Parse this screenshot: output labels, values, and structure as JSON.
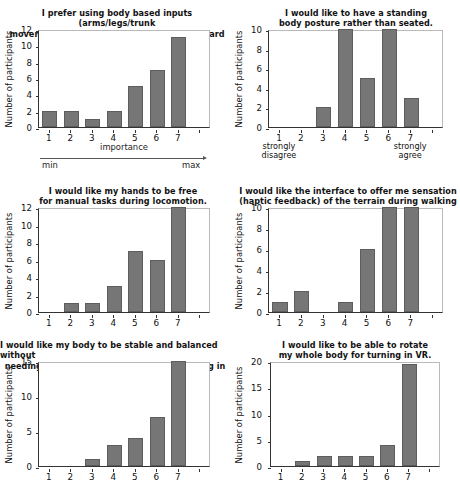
{
  "figure": {
    "ylabel": "Number of participants",
    "panels": 6
  },
  "chart_data": [
    {
      "type": "bar",
      "id": "panel-1",
      "title": "I prefer using body based inputs (arms/legs/trunk movements) compared to joystick or keyboard input.",
      "title_lines": [
        "I prefer using body based inputs (arms/legs/trunk",
        "movements) compared to joystick or keyboard input."
      ],
      "categories": [
        "1",
        "2",
        "3",
        "4",
        "5",
        "6",
        "7"
      ],
      "values": [
        2,
        2,
        1,
        2,
        5,
        7,
        11
      ],
      "xlabel": "importance",
      "ylabel": "Number of participants",
      "ylim": [
        0,
        12
      ],
      "yticks": [
        0,
        2,
        4,
        6,
        8,
        10,
        12
      ],
      "grid": false,
      "annotations": {
        "left_end": "min",
        "right_end": "max",
        "arrow": "right"
      }
    },
    {
      "type": "bar",
      "id": "panel-2",
      "title": "I would like to have a standing body posture rather than seated.",
      "title_lines": [
        "I would like to have a standing",
        "body posture rather than seated."
      ],
      "categories": [
        "1",
        "2",
        "3",
        "4",
        "5",
        "6",
        "7"
      ],
      "values": [
        0,
        0,
        2,
        10,
        5,
        10,
        3
      ],
      "xlabel": "",
      "ylabel": "Number of participants",
      "ylim": [
        0,
        10
      ],
      "yticks": [
        0,
        2,
        4,
        6,
        8,
        10
      ],
      "grid": false,
      "annotations": {
        "anchor_low": "strongly\ndisagree",
        "anchor_high": "strongly\nagree"
      }
    },
    {
      "type": "bar",
      "id": "panel-3",
      "title": "I would like my hands to be free for manual tasks during locomotion.",
      "title_lines": [
        "I would like my hands to be free",
        "for manual tasks during locomotion."
      ],
      "categories": [
        "1",
        "2",
        "3",
        "4",
        "5",
        "6",
        "7"
      ],
      "values": [
        0,
        1,
        1,
        3,
        7,
        6,
        12
      ],
      "xlabel": "",
      "ylabel": "Number of participants",
      "ylim": [
        0,
        12
      ],
      "yticks": [
        0,
        2,
        4,
        6,
        8,
        10,
        12
      ],
      "grid": false
    },
    {
      "type": "bar",
      "id": "panel-4",
      "title": "I would like the interface to offer me sensation (haptic feedback) of the terrain during walking",
      "title_lines": [
        "I would like the interface to offer me sensation",
        "(haptic feedback) of the terrain during walking"
      ],
      "categories": [
        "1",
        "2",
        "3",
        "4",
        "5",
        "6",
        "7"
      ],
      "values": [
        1,
        2,
        0,
        1,
        6,
        10,
        10
      ],
      "xlabel": "",
      "ylabel": "Number of participants",
      "ylim": [
        0,
        10
      ],
      "yticks": [
        0,
        2,
        4,
        6,
        8,
        10
      ],
      "grid": false
    },
    {
      "type": "bar",
      "id": "panel-5",
      "title": "I would like my body to be stable and balanced without needing of additional support during walking in VR.",
      "title_lines": [
        "I would like my body to be stable and balanced without",
        "needing of additional support during walking in VR."
      ],
      "categories": [
        "1",
        "2",
        "3",
        "4",
        "5",
        "6",
        "7"
      ],
      "values": [
        0,
        0,
        1,
        3,
        4,
        7,
        15
      ],
      "xlabel": "",
      "ylabel": "Number of participants",
      "ylim": [
        0,
        15
      ],
      "yticks": [
        0,
        5,
        10,
        15
      ],
      "grid": false
    },
    {
      "type": "bar",
      "id": "panel-6",
      "title": "I would like to be able to rotate my whole body for turning in VR.",
      "title_lines": [
        "I would like to be able to rotate",
        "my whole body for turning in VR."
      ],
      "categories": [
        "1",
        "2",
        "3",
        "4",
        "5",
        "6",
        "7"
      ],
      "values": [
        0,
        1,
        2,
        2,
        2,
        4,
        19.5
      ],
      "xlabel": "",
      "ylabel": "Number of participants",
      "ylim": [
        0,
        20
      ],
      "yticks": [
        0,
        5,
        10,
        15,
        20
      ],
      "grid": false
    }
  ],
  "colors": {
    "bar_fill": "#767676",
    "bar_edge": "#5d5d5d",
    "axis": "#333333",
    "text": "#111111",
    "background": "#ffffff"
  }
}
